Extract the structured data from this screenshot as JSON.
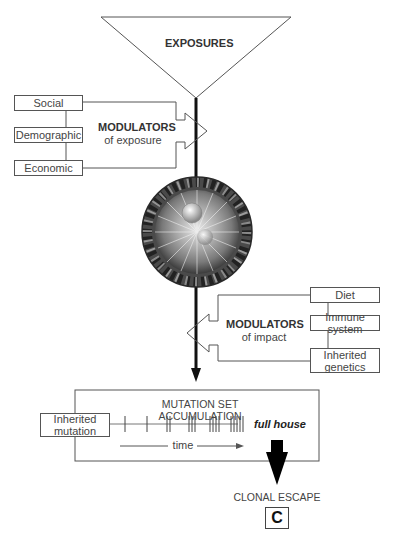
{
  "exposures": {
    "label": "EXPOSURES"
  },
  "modulators_exposure": {
    "title": "MODULATORS",
    "subtitle": "of exposure",
    "items": [
      "Social",
      "Demographic",
      "Economic"
    ]
  },
  "roulette_wheel": {
    "description": "roulette-wheel-image"
  },
  "modulators_impact": {
    "title": "MODULATORS",
    "subtitle": "of impact",
    "items": [
      "Diet",
      "Immune system",
      "Inherited genetics"
    ],
    "item_lines": {
      "inherited_line1": "Inherited",
      "inherited_line2": "genetics"
    }
  },
  "mutation": {
    "title": "MUTATION SET ACCUMULATION",
    "inherited_line1": "Inherited",
    "inherited_line2": "mutation",
    "tick_groups": [
      1,
      1,
      2,
      3,
      4,
      5
    ],
    "time_label": "time",
    "result_label": "full house"
  },
  "outcome": {
    "label": "CLONAL ESCAPE",
    "panel_letter": "C"
  },
  "colors": {
    "line": "#555555",
    "axis": "#111111",
    "wheel_rim": "#4a4a4a"
  }
}
